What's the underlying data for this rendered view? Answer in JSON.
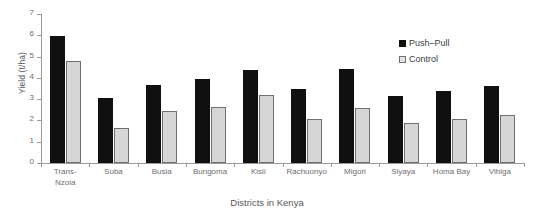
{
  "chart_data": {
    "type": "bar",
    "title": "",
    "xlabel": "Districts in Kenya",
    "ylabel": "Yield (t/ha)",
    "ylim": [
      0,
      7
    ],
    "yticks": [
      0,
      1,
      2,
      3,
      4,
      5,
      6,
      7
    ],
    "grid": false,
    "legend_position": "top-right",
    "categories": [
      "Trans-Nzoia",
      "Suba",
      "Busia",
      "Bungoma",
      "Kisii",
      "Rachuonyo",
      "Migori",
      "Siyaya",
      "Homa Bay",
      "Vihiga"
    ],
    "category_lines": [
      [
        "Trans-",
        "Nzoia"
      ],
      [
        "Suba"
      ],
      [
        "Busia"
      ],
      [
        "Bungoma"
      ],
      [
        "Kisii"
      ],
      [
        "Rachuonyo"
      ],
      [
        "Migori"
      ],
      [
        "Siyaya"
      ],
      [
        "Homa Bay"
      ],
      [
        "Vihiga"
      ]
    ],
    "series": [
      {
        "name": "Push–Pull",
        "color": "#101010",
        "values": [
          5.95,
          3.05,
          3.65,
          3.95,
          4.35,
          3.5,
          4.4,
          3.15,
          3.4,
          3.6
        ]
      },
      {
        "name": "Control",
        "color": "#d6d6d6",
        "values": [
          4.8,
          1.65,
          2.45,
          2.65,
          3.2,
          2.05,
          2.6,
          1.9,
          2.05,
          2.25
        ]
      }
    ]
  },
  "legend": {
    "items": [
      {
        "label": "Push–Pull",
        "marker": "filled-square"
      },
      {
        "label": "Control",
        "marker": "open-square"
      }
    ]
  },
  "axis": {
    "y_title": "Yield (t/ha)",
    "x_title": "Districts in Kenya",
    "y_tick_labels": [
      "0",
      "1",
      "2",
      "3",
      "4",
      "5",
      "6",
      "7"
    ]
  },
  "colors": {
    "push_pull": "#101010",
    "control": "#d6d6d6",
    "axis": "#9a9a9c",
    "text": "#58585a"
  }
}
